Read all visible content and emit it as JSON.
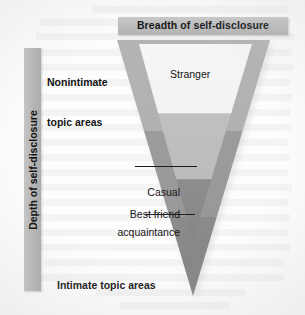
{
  "figure": {
    "type": "diagram",
    "shape": "inverted-triangle",
    "axes": {
      "horizontal": {
        "label": "Breadth of self-disclosure",
        "orientation": "horizontal",
        "position": "top",
        "bar_color": "#bdbdbd"
      },
      "vertical": {
        "label": "Depth of self-disclosure",
        "orientation": "vertical-rotated-90",
        "position": "left",
        "bar_color": "#b8b8b8"
      }
    },
    "endpoint_labels": {
      "top": "Nonintimate\ntopic areas",
      "top_line1": "Nonintimate",
      "top_line2": "topic areas",
      "bottom": "Intimate topic areas"
    },
    "relationship_levels": [
      {
        "id": "stranger",
        "label": "Stranger",
        "band": "top",
        "fill_color": "#f2f2f2",
        "has_leader_line": false
      },
      {
        "id": "casual-acquaintance",
        "label": "Casual\nacquaintance",
        "label_line1": "Casual",
        "label_line2": "acquaintance",
        "band": "middle",
        "fill_color": "#b9b9b9",
        "has_leader_line": true
      },
      {
        "id": "best-friend",
        "label": "Best friend",
        "band": "lower",
        "fill_color": "#9a9a9a",
        "has_leader_line": true
      }
    ],
    "wedge_colors": {
      "arms_upper": "#b0b0b0",
      "arms_lower": "#9d9d9d",
      "inner_top": "#f4f4f4",
      "inner_middle": "#c3c3c3",
      "inner_lower": "#8f8f8f",
      "tip": "#7e7e7e"
    },
    "background_color": "#fdfdfd",
    "text_color": "#141414"
  }
}
